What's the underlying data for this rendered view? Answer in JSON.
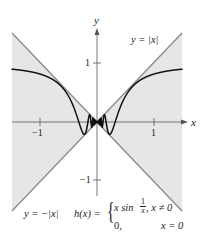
{
  "figure": {
    "axis_labels": {
      "x": "x",
      "y": "y"
    },
    "ticks": {
      "x_neg": "−1",
      "x_pos": "1",
      "y_pos": "1",
      "y_neg": "−1"
    },
    "labels": {
      "upper_bound": "y = |x|",
      "lower_bound": "y = −|x|",
      "h_name": "h(x) = ",
      "case1_expr": "x sin",
      "case1_frac_num": "1",
      "case1_frac_den": "x",
      "case1_cond": ", x ≠ 0",
      "case2_expr": "0,",
      "case2_cond": "x = 0"
    },
    "colors": {
      "shade": "#e6e6e6",
      "bound_lines": "#8a8a8a",
      "curve": "#111111",
      "axes": "#555555"
    }
  },
  "chart_data": {
    "type": "line",
    "title": "",
    "xlabel": "x",
    "ylabel": "y",
    "xlim": [
      -1.5,
      1.5
    ],
    "ylim": [
      -1.55,
      1.55
    ],
    "x_ticks": [
      -1,
      1
    ],
    "y_ticks": [
      -1,
      1
    ],
    "grid": false,
    "series": [
      {
        "name": "y = |x|",
        "function": "abs(x)",
        "style": "gray line"
      },
      {
        "name": "y = -|x|",
        "function": "-abs(x)",
        "style": "gray line"
      },
      {
        "name": "h(x) = x sin(1/x), x≠0; 0, x=0",
        "function": "x*sin(1/x)",
        "style": "black curve",
        "sample_points": [
          [
            -1.5,
            0.98
          ],
          [
            -1,
            0.84
          ],
          [
            -0.5,
            0.45
          ],
          [
            -0.3,
            -0.06
          ],
          [
            -0.2,
            -0.19
          ],
          [
            0,
            0
          ],
          [
            0.2,
            -0.19
          ],
          [
            0.3,
            -0.06
          ],
          [
            0.5,
            0.45
          ],
          [
            1,
            0.84
          ],
          [
            1.5,
            0.98
          ]
        ]
      }
    ],
    "shaded_region": "between y=-|x| and y=|x| (|y| ≤ |x|)",
    "annotations": [
      "y = |x|",
      "y = −|x|",
      "h(x) = { x sin(1/x), x ≠ 0 ; 0, x = 0 }"
    ]
  }
}
